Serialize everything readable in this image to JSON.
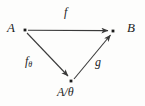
{
  "diagram": {
    "type": "commutative-triangle",
    "background_color": "#fdfdfc",
    "stroke_color": "#3a3a3a",
    "text_color": "#1c1c1c",
    "nodes": [
      {
        "id": "A",
        "label": "A",
        "x": 25,
        "y": 30,
        "label_x": 7,
        "label_y": 21
      },
      {
        "id": "B",
        "label": "B",
        "x": 113,
        "y": 31,
        "label_x": 127,
        "label_y": 21
      },
      {
        "id": "Aquot",
        "label": "A/θ",
        "x": 71,
        "y": 81,
        "label_x": 57,
        "label_y": 86
      }
    ],
    "edges": [
      {
        "id": "f",
        "label": "f",
        "subscript": "",
        "from": "A",
        "to": "B",
        "label_x": 64,
        "label_y": 6
      },
      {
        "id": "f-theta",
        "label": "f",
        "subscript": "θ",
        "from": "A",
        "to": "Aquot",
        "label_x": 25,
        "label_y": 55
      },
      {
        "id": "g",
        "label": "g",
        "subscript": "",
        "from": "Aquot",
        "to": "B",
        "label_x": 95,
        "label_y": 56
      }
    ]
  }
}
